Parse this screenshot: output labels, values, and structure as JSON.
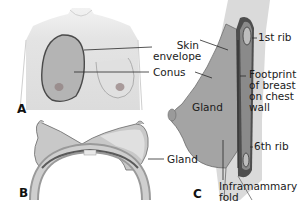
{
  "figure": {
    "panels": [
      {
        "id": "A",
        "letter": "A",
        "view": "frontal"
      },
      {
        "id": "B",
        "letter": "B",
        "view": "axial cross-section"
      },
      {
        "id": "C",
        "letter": "C",
        "view": "sagittal"
      }
    ],
    "labels": {
      "skin_envelope": "Skin\nenvelope",
      "conus": "Conus",
      "gland_c": "Gland",
      "gland_b": "Gland",
      "first_rib": "1st rib",
      "footprint": "Footprint\nof breast\non chest\nwall",
      "sixth_rib": "6th rib",
      "inframammary_fold": "Inframammary\nfold"
    },
    "colors": {
      "skin": "#e6e6e6",
      "skin_dark": "#cfcfcf",
      "gland": "#a8a8a8",
      "outline": "#4a4a4a",
      "chest_wall": "#5e5e5e",
      "rib": "#8a8a8a"
    }
  }
}
